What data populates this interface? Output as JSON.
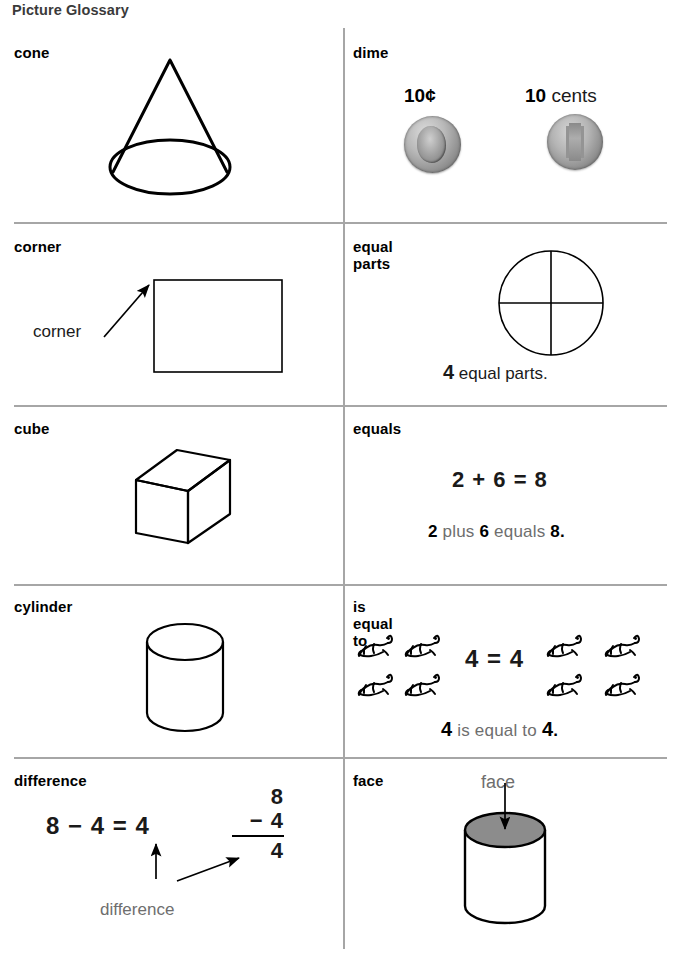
{
  "page": {
    "title": "Picture Glossary"
  },
  "entries": [
    {
      "term": "cone",
      "illustration": "cone-shape",
      "labels": []
    },
    {
      "term": "dime",
      "illustration": "dime-coins",
      "labels": [
        "10¢",
        "10 cents"
      ],
      "coin_front_alt": "dime-obverse",
      "coin_back_alt": "dime-reverse"
    },
    {
      "term": "corner",
      "illustration": "rectangle-with-corner-arrow",
      "labels": [
        "corner"
      ]
    },
    {
      "term": "equal parts",
      "illustration": "circle-divided-in-fourths",
      "caption_number": "4",
      "caption_text": " equal parts."
    },
    {
      "term": "cube",
      "illustration": "cube-shape",
      "labels": []
    },
    {
      "term": "equals",
      "illustration": "equation",
      "equation": "2 + 6 = 8",
      "sentence_parts": [
        "2",
        " plus ",
        "6",
        " equals ",
        "8",
        "."
      ]
    },
    {
      "term": "cylinder",
      "illustration": "cylinder-shape",
      "labels": []
    },
    {
      "term": "is equal to",
      "illustration": "frogs-comparison",
      "equation": "4 = 4",
      "frogs_left": 4,
      "frogs_right": 4,
      "sentence_parts": [
        "4",
        " is equal to ",
        "4",
        "."
      ]
    },
    {
      "term": "difference",
      "illustration": "subtraction",
      "horizontal_equation": "8 − 4 = 4",
      "vertical_equation": {
        "minuend": "8",
        "operator": "−",
        "subtrahend": "4",
        "result": "4"
      },
      "callout_label": "difference"
    },
    {
      "term": "face",
      "illustration": "cylinder-with-shaded-face",
      "callout_label": "face"
    }
  ],
  "colors": {
    "rule": "#a6a6a6",
    "ink": "#000000",
    "gray_text": "#6e6e6e",
    "shaded_face": "#8c8c8c",
    "title": "#3a3a3a"
  }
}
